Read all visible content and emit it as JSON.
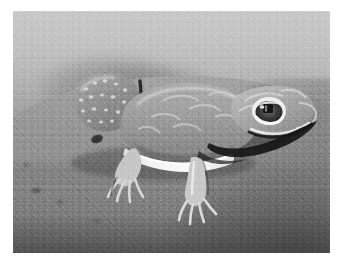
{
  "image": {
    "kind": "photograph",
    "color_mode": "grayscale",
    "subject": "knob-tailed gecko on sand",
    "scene": "desert sand substrate at night, flash lit",
    "border": {
      "color": "#ffffff",
      "left": 13,
      "top": 11,
      "right": 12,
      "bottom": 14
    },
    "photo_area": {
      "x": 13,
      "y": 11,
      "width": 317,
      "height": 242
    },
    "palette": {
      "border_white": "#ffffff",
      "background_light": "#c9c9c9",
      "background_mid": "#9b9b9b",
      "foreground_sand": "#7c7c7c",
      "foreground_dark": "#6f6f6f",
      "gecko_body": "#9f9f9f",
      "gecko_highlight": "#efefef",
      "gecko_belly_white": "#f6f6f6",
      "gecko_shadow": "#2a2a2a",
      "eye_ring": "#f2f2f2",
      "eye_pupil": "#181818",
      "tail_spots": "#e4e4e4"
    },
    "regions": [
      {
        "name": "far-background-wall",
        "description": "smooth light grey out-of-focus sand bank, top 46% of frame"
      },
      {
        "name": "dark-smudge",
        "description": "blurred darker rock shapes across upper-middle background"
      },
      {
        "name": "sand-mound",
        "description": "mid-ground mound the gecko rests on"
      },
      {
        "name": "foreground-sand",
        "description": "coarse darker grainy sand, lower third, darkest at bottom-right"
      },
      {
        "name": "gecko",
        "description": "pale grey gecko facing right, body in profile"
      }
    ],
    "subject_parts": [
      {
        "name": "knob-tail",
        "description": "bulbous spotted tail at left, pale spots on dark grey"
      },
      {
        "name": "hind-leg",
        "description": "rear leg with splayed toes, lower left of body"
      },
      {
        "name": "body",
        "description": "rounded grey torso with mottled pale markings"
      },
      {
        "name": "belly-stripe",
        "description": "bright white flank stripe running along lower body"
      },
      {
        "name": "front-leg",
        "description": "foreleg extending down-right with long toes"
      },
      {
        "name": "head",
        "description": "broad rounded head at right with pale arc markings"
      },
      {
        "name": "eye",
        "description": "large bright-rimmed eye with dark vertical pupil"
      },
      {
        "name": "snout",
        "description": "blunt snout and mouth line at far right"
      },
      {
        "name": "cast-shadow",
        "description": "dark shadow under chin and along lower jaw"
      }
    ]
  }
}
